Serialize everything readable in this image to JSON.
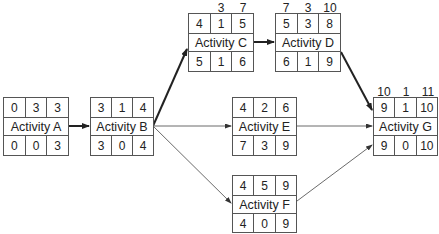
{
  "diagram": {
    "type": "critical-path-network",
    "nodes": {
      "A": {
        "name": "Activity A",
        "top": [
          "0",
          "3",
          "3"
        ],
        "bottom": [
          "0",
          "0",
          "3"
        ]
      },
      "B": {
        "name": "Activity B",
        "top": [
          "3",
          "1",
          "4"
        ],
        "bottom": [
          "3",
          "0",
          "4"
        ]
      },
      "C": {
        "name": "Activity C",
        "above": [
          "",
          "3",
          "7"
        ],
        "top": [
          "4",
          "1",
          "5"
        ],
        "bottom": [
          "5",
          "1",
          "6"
        ]
      },
      "D": {
        "name": "Activity D",
        "above": [
          "7",
          "3",
          "10"
        ],
        "top": [
          "5",
          "3",
          "8"
        ],
        "bottom": [
          "6",
          "1",
          "9"
        ]
      },
      "E": {
        "name": "Activity E",
        "top": [
          "4",
          "2",
          "6"
        ],
        "bottom": [
          "7",
          "3",
          "9"
        ]
      },
      "F": {
        "name": "Activity F",
        "top": [
          "4",
          "5",
          "9"
        ],
        "bottom": [
          "4",
          "0",
          "9"
        ]
      },
      "G": {
        "name": "Activity G",
        "above": [
          "10",
          "1",
          "11"
        ],
        "top": [
          "9",
          "1",
          "10"
        ],
        "bottom": [
          "9",
          "0",
          "10"
        ]
      }
    },
    "edges": [
      {
        "from": "A",
        "to": "B",
        "critical": true
      },
      {
        "from": "B",
        "to": "C",
        "critical": true
      },
      {
        "from": "B",
        "to": "E",
        "critical": false
      },
      {
        "from": "B",
        "to": "F",
        "critical": false
      },
      {
        "from": "C",
        "to": "D",
        "critical": true
      },
      {
        "from": "D",
        "to": "G",
        "critical": true
      },
      {
        "from": "E",
        "to": "G",
        "critical": false
      },
      {
        "from": "F",
        "to": "G",
        "critical": false
      }
    ],
    "colors": {
      "line": "#222222",
      "border": "#555555",
      "background": "#ffffff"
    }
  }
}
